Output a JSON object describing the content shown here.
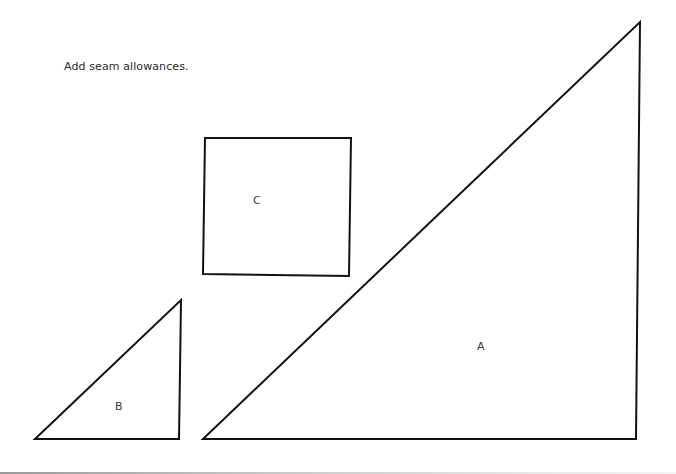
{
  "instruction": "Add seam allowances.",
  "pieces": [
    {
      "id": "A",
      "shape": "right-triangle",
      "label": "A",
      "points": [
        [
          203,
          439
        ],
        [
          636,
          439
        ],
        [
          640,
          22
        ]
      ]
    },
    {
      "id": "B",
      "shape": "right-triangle",
      "label": "B",
      "points": [
        [
          35,
          439
        ],
        [
          179,
          439
        ],
        [
          181,
          300
        ]
      ]
    },
    {
      "id": "C",
      "shape": "square",
      "label": "C",
      "points": [
        [
          205,
          138
        ],
        [
          351,
          138
        ],
        [
          349,
          276
        ],
        [
          203,
          274
        ]
      ]
    }
  ],
  "colors": {
    "stroke": "#111111",
    "background": "#ffffff"
  }
}
